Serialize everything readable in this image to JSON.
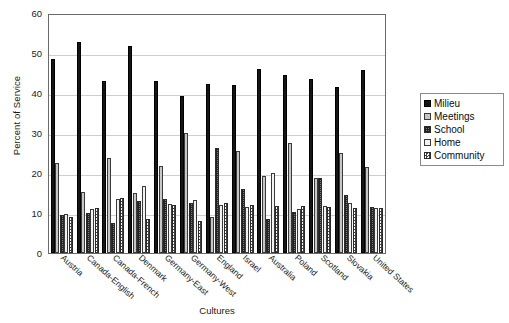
{
  "chart_data": {
    "type": "bar",
    "title": "",
    "xlabel": "Cultures",
    "ylabel": "Percent of Service",
    "ylim": [
      0,
      60
    ],
    "yticks": [
      60,
      50,
      40,
      30,
      20,
      10,
      0
    ],
    "grid": true,
    "legend_position": "right",
    "categories": [
      "Austria",
      "Canada-English",
      "Canada-French",
      "Denmark",
      "Germany-East",
      "Germany-West",
      "England",
      "Israel",
      "Australia",
      "Poland",
      "Scotland",
      "Slovakia",
      "United States"
    ],
    "series": [
      {
        "name": "Milieu",
        "pattern": "solid-black",
        "values": [
          48.5,
          52.8,
          43.0,
          51.8,
          43.0,
          39.2,
          42.3,
          42.0,
          46.0,
          44.5,
          43.5,
          41.5,
          45.8
        ]
      },
      {
        "name": "Meetings",
        "pattern": "solid-light-grey",
        "values": [
          22.5,
          15.2,
          23.7,
          15.0,
          21.7,
          30.0,
          9.0,
          25.5,
          19.2,
          27.5,
          18.7,
          25.0,
          21.5
        ]
      },
      {
        "name": "School",
        "pattern": "dense-dark-hatch",
        "values": [
          9.4,
          10.0,
          7.5,
          13.0,
          13.5,
          12.5,
          26.2,
          16.0,
          8.5,
          10.2,
          18.7,
          14.5,
          11.5
        ]
      },
      {
        "name": "Home",
        "pattern": "white",
        "values": [
          9.7,
          11.0,
          13.5,
          16.7,
          12.3,
          13.2,
          12.0,
          11.5,
          20.0,
          11.0,
          11.8,
          12.5,
          11.3
        ]
      },
      {
        "name": "Community",
        "pattern": "checkerboard",
        "values": [
          9.0,
          11.3,
          13.7,
          8.5,
          12.0,
          8.0,
          12.5,
          12.0,
          11.7,
          11.8,
          11.5,
          11.3,
          11.3
        ]
      }
    ]
  },
  "legend": {
    "items": [
      {
        "label": "Milieu"
      },
      {
        "label": "Meetings"
      },
      {
        "label": "School"
      },
      {
        "label": "Home"
      },
      {
        "label": "Community"
      }
    ]
  }
}
